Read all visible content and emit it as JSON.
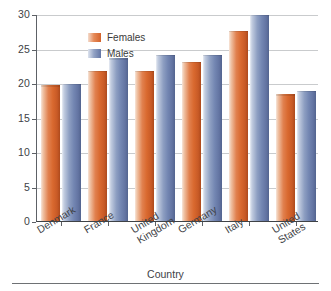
{
  "chart_data": {
    "type": "bar",
    "title": "",
    "xlabel": "Country",
    "ylabel": "Age",
    "ylim": [
      0,
      30
    ],
    "yticks": [
      0,
      5,
      10,
      15,
      20,
      25,
      30
    ],
    "ytick_labels": [
      "0",
      "5",
      "10",
      "15",
      "20",
      "25",
      "30"
    ],
    "grid": "horizontal",
    "legend_position": "top-left-inside",
    "categories": [
      "Denmark",
      "France",
      "United Kingdom",
      "Germany",
      "Italy",
      "United States"
    ],
    "category_label_lines": [
      [
        "Denmark"
      ],
      [
        "France"
      ],
      [
        "United",
        "Kingdom"
      ],
      [
        "Germany"
      ],
      [
        "Italy"
      ],
      [
        "United",
        "States"
      ]
    ],
    "series": [
      {
        "name": "Females",
        "color": "#d9692f",
        "values": [
          19.8,
          21.9,
          21.9,
          23.2,
          27.7,
          18.5
        ]
      },
      {
        "name": "Males",
        "color": "#7386b2",
        "values": [
          20.0,
          23.7,
          24.2,
          24.2,
          30.0,
          19.0
        ]
      }
    ]
  },
  "legend": {
    "items": [
      {
        "label": "Females",
        "swatch": "females-swatch"
      },
      {
        "label": "Males",
        "swatch": "males-swatch"
      }
    ]
  },
  "axes": {
    "y_title": "Age",
    "x_title": "Country"
  }
}
